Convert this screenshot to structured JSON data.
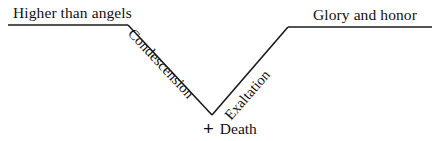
{
  "diagram": {
    "title_text_top_left": "Higher than angels",
    "title_text_top_right": "Glory and honor",
    "left_limb_label": "Condescension",
    "right_limb_label": "Exaltation",
    "vertex_label": "Death",
    "vertex_symbol": "+",
    "stroke_color": "#1a1a1a",
    "text_color": "#111111",
    "background_color": "#ffffff"
  },
  "chart_data": {
    "type": "line",
    "title": "",
    "subtitle": "",
    "xlabel": "",
    "ylabel": "",
    "grid": false,
    "legend_position": "none",
    "annotations": [
      {
        "text": "Higher than angels",
        "anchor": "above-left-plateau"
      },
      {
        "text": "Condescension",
        "anchor": "descending-limb",
        "rotation_deg": 47
      },
      {
        "text": "Exaltation",
        "anchor": "ascending-limb",
        "rotation_deg": -49
      },
      {
        "text": "+ Death",
        "anchor": "vertex-bottom"
      },
      {
        "text": "Glory and honor",
        "anchor": "above-right-plateau"
      }
    ],
    "series": [
      {
        "name": "Kenosis path",
        "points": [
          {
            "x": 8,
            "y": 25,
            "label": "Higher than angels"
          },
          {
            "x": 128,
            "y": 25,
            "label": ""
          },
          {
            "x": 212,
            "y": 115,
            "label": "Death"
          },
          {
            "x": 288,
            "y": 27,
            "label": ""
          },
          {
            "x": 432,
            "y": 27,
            "label": "Glory and honor"
          }
        ]
      }
    ],
    "underlines": [
      {
        "x1": 8,
        "x2": 128,
        "y": 25
      },
      {
        "x1": 288,
        "x2": 432,
        "y": 27
      }
    ]
  }
}
